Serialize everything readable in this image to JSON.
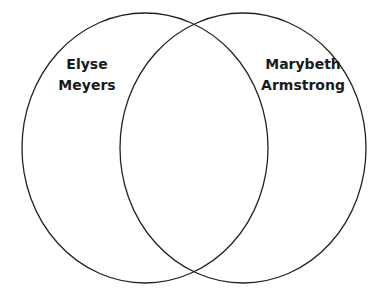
{
  "diagram": {
    "type": "venn",
    "stroke_color": "#222222",
    "background": "#ffffff",
    "sets": [
      {
        "name": "left-set",
        "label_lines": [
          "Elyse",
          "Meyers"
        ]
      },
      {
        "name": "right-set",
        "label_lines": [
          "Marybeth",
          "Armstrong"
        ]
      }
    ]
  }
}
